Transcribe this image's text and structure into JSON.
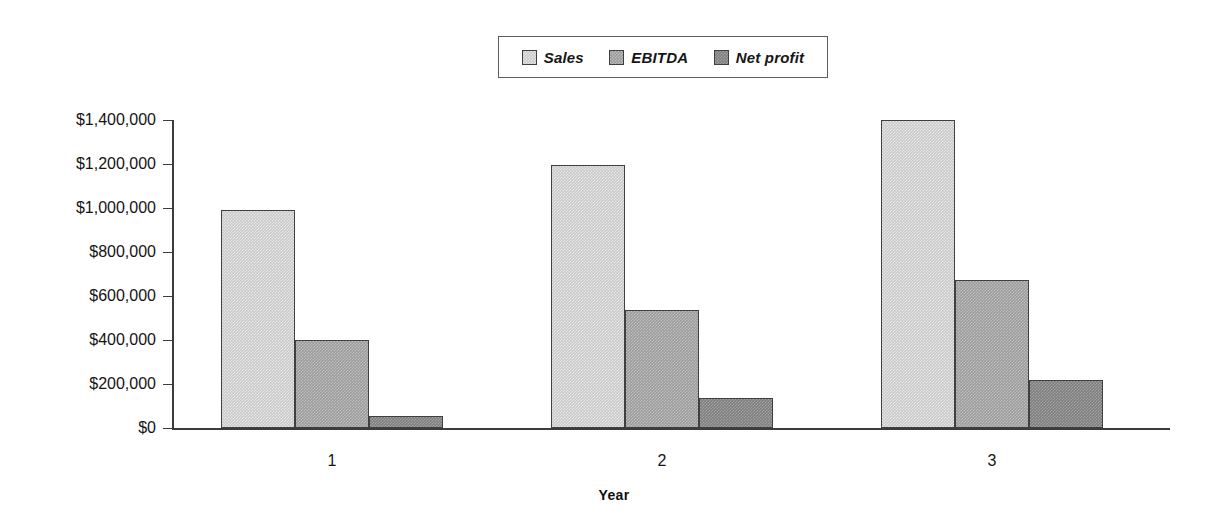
{
  "chart_data": {
    "type": "bar",
    "title": "",
    "xlabel": "Year",
    "ylabel": "",
    "categories": [
      "1",
      "2",
      "3"
    ],
    "series": [
      {
        "name": "Sales",
        "color": "#c9c9c9",
        "values": [
          990000,
          1195000,
          1400000
        ]
      },
      {
        "name": "EBITDA",
        "color": "#9b9b9b",
        "values": [
          400000,
          535000,
          672000
        ]
      },
      {
        "name": "Net profit",
        "color": "#7e7e7e",
        "values": [
          55000,
          135000,
          220000
        ]
      }
    ],
    "ylim": [
      0,
      1400000
    ],
    "ytick_values": [
      0,
      200000,
      400000,
      600000,
      800000,
      1000000,
      1200000,
      1400000
    ],
    "ytick_labels": [
      "$0",
      "$200,000",
      "$400,000",
      "$600,000",
      "$800,000",
      "$1,000,000",
      "$1,200,000",
      "$1,400,000"
    ],
    "grid": false,
    "legend_position": "top-center",
    "legend_entries": [
      "Sales",
      "EBITDA",
      "Net profit"
    ]
  },
  "axis": {
    "x_title": "Year",
    "y_title": ""
  }
}
